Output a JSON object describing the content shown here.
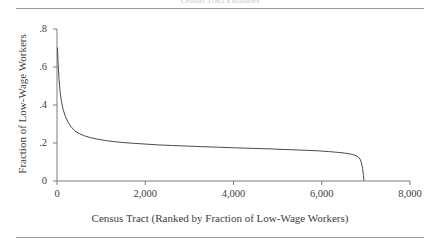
{
  "figure": {
    "header_caption": "Census Tract Estimates",
    "has_top_rule": true,
    "has_bottom_rule": true,
    "background": "#ffffff",
    "line_color": "#4a4a4a",
    "axis_color": "#7d7d7d",
    "text_color": "#3d3d3d"
  },
  "chart_data": {
    "type": "line",
    "title": "",
    "xlabel": "Census Tract (Ranked by Fraction of Low-Wage Workers)",
    "ylabel": "Fraction of Low-Wage Workers",
    "xlim": [
      0,
      8000
    ],
    "ylim": [
      0,
      0.8
    ],
    "xticks": [
      0,
      2000,
      4000,
      6000,
      8000
    ],
    "xtick_labels": [
      "0",
      "2,000",
      "4,000",
      "6,000",
      "8,000"
    ],
    "yticks": [
      0,
      0.2,
      0.4,
      0.6,
      0.8
    ],
    "ytick_labels": [
      "0",
      ".2",
      ".4",
      ".6",
      ".8"
    ],
    "grid": false,
    "legend": "none",
    "series": [
      {
        "name": "Fraction of Low-Wage Workers",
        "x": [
          10,
          25,
          45,
          70,
          100,
          140,
          190,
          250,
          320,
          400,
          500,
          620,
          760,
          920,
          1100,
          1300,
          1520,
          1760,
          2020,
          2300,
          2600,
          2920,
          3260,
          3620,
          4000,
          4400,
          4820,
          5260,
          5600,
          5900,
          6150,
          6350,
          6520,
          6650,
          6750,
          6820,
          6870,
          6900,
          6925,
          6945,
          6955
        ],
        "y": [
          0.7,
          0.62,
          0.54,
          0.47,
          0.42,
          0.375,
          0.34,
          0.31,
          0.285,
          0.265,
          0.25,
          0.238,
          0.228,
          0.22,
          0.213,
          0.207,
          0.202,
          0.198,
          0.194,
          0.19,
          0.187,
          0.184,
          0.181,
          0.178,
          0.175,
          0.172,
          0.169,
          0.165,
          0.162,
          0.159,
          0.155,
          0.151,
          0.147,
          0.142,
          0.136,
          0.128,
          0.115,
          0.095,
          0.066,
          0.03,
          0.004
        ]
      }
    ]
  }
}
